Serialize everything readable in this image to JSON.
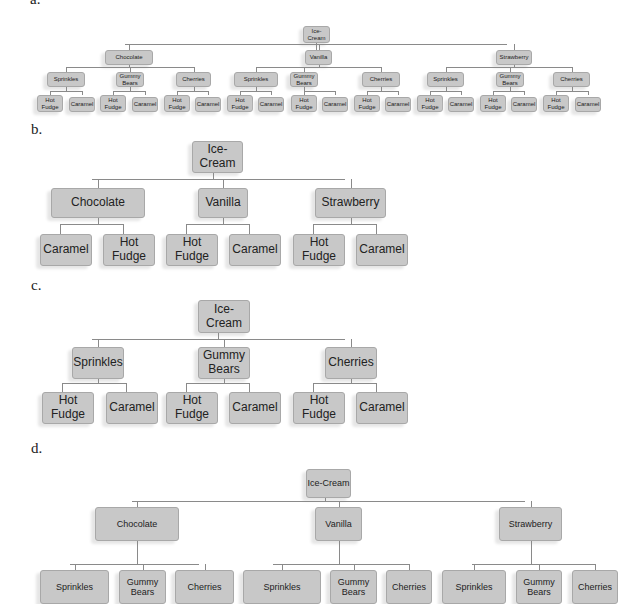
{
  "labels": {
    "a": "a.",
    "b": "b.",
    "c": "c.",
    "d": "d."
  },
  "diagram_a": {
    "root": "Ice-Cream",
    "flavors": [
      "Chocolate",
      "Vanilla",
      "Strawberry"
    ],
    "toppings": [
      "Sprinkles",
      "Gummy Bears",
      "Cherries"
    ],
    "sauces": [
      "Hot Fudge",
      "Caramel"
    ]
  },
  "diagram_b": {
    "root": "Ice-Cream",
    "flavors": [
      {
        "name": "Chocolate",
        "children": [
          "Caramel",
          "Hot Fudge"
        ]
      },
      {
        "name": "Vanilla",
        "children": [
          "Hot Fudge",
          "Caramel"
        ]
      },
      {
        "name": "Strawberry",
        "children": [
          "Hot Fudge",
          "Caramel"
        ]
      }
    ]
  },
  "diagram_c": {
    "root": "Ice-Cream",
    "toppings": [
      {
        "name": "Sprinkles",
        "children": [
          "Hot Fudge",
          "Caramel"
        ]
      },
      {
        "name": "Gummy Bears",
        "children": [
          "Hot Fudge",
          "Caramel"
        ]
      },
      {
        "name": "Cherries",
        "children": [
          "Hot Fudge",
          "Caramel"
        ]
      }
    ]
  },
  "diagram_d": {
    "root": "Ice-Cream",
    "flavors": [
      {
        "name": "Chocolate",
        "children": [
          "Sprinkles",
          "Gummy Bears",
          "Cherries"
        ]
      },
      {
        "name": "Vanilla",
        "children": [
          "Sprinkles",
          "Gummy Bears",
          "Cherries"
        ]
      },
      {
        "name": "Strawberry",
        "children": [
          "Sprinkles",
          "Gummy Bears",
          "Cherries"
        ]
      }
    ]
  }
}
